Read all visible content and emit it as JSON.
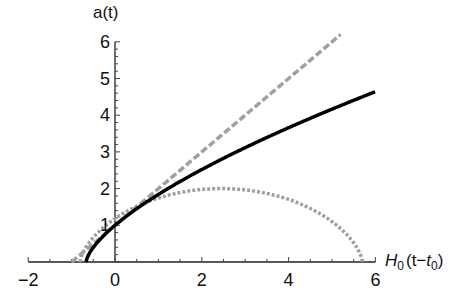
{
  "chart_data": {
    "type": "line",
    "title": "",
    "xlabel": "H0(t−t0)",
    "ylabel": "a(t)",
    "xlim": [
      -2,
      6
    ],
    "ylim": [
      0,
      6
    ],
    "x_ticks": [
      "−2",
      "0",
      "2",
      "4",
      "6"
    ],
    "y_ticks": [
      "1",
      "2",
      "3",
      "4",
      "5",
      "6"
    ],
    "grid": false,
    "legend": null,
    "series": [
      {
        "name": "flat matter-dominated (solid black)",
        "style": "solid",
        "color": "#000000",
        "x": [
          -0.667,
          -0.6,
          -0.5,
          -0.25,
          0,
          1,
          2,
          3,
          4,
          5,
          6
        ],
        "y": [
          0,
          0.3,
          0.48,
          0.78,
          1.0,
          1.71,
          2.29,
          2.78,
          3.24,
          3.65,
          4.64
        ]
      },
      {
        "name": "linear expansion (dashed gray)",
        "style": "dashed",
        "color": "#999999",
        "x": [
          -1,
          0,
          1,
          2,
          3,
          4,
          5.2
        ],
        "y": [
          0,
          1,
          2,
          3,
          4,
          5,
          6
        ]
      },
      {
        "name": "closed / recollapsing (dotted gray)",
        "style": "dotted",
        "color": "#999999",
        "x": [
          -0.8,
          -0.5,
          0,
          1,
          2,
          2.7,
          3.5,
          4.5,
          5.2,
          5.7
        ],
        "y": [
          0,
          0.6,
          1.0,
          1.6,
          1.95,
          2.0,
          1.9,
          1.5,
          0.9,
          0
        ]
      }
    ]
  },
  "axes": {
    "x_label_main": "H",
    "x_label_sub": "0",
    "x_label_mid": "(t−",
    "x_label_t": "t",
    "x_label_sub2": "0",
    "x_label_end": ")",
    "y_label": "a(t)",
    "x_tick_labels": [
      "−2",
      "0",
      "2",
      "4",
      "6"
    ],
    "y_tick_labels": [
      "1",
      "2",
      "3",
      "4",
      "5",
      "6"
    ]
  }
}
